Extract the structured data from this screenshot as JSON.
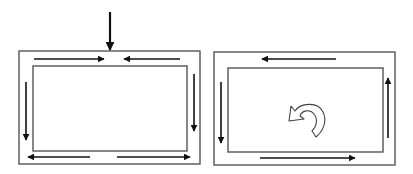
{
  "diagram": {
    "colors": {
      "background": "#ffffff",
      "frame_stroke": "#555555",
      "arrow": "#111111",
      "curved_arrow_fill": "#ffffff",
      "curved_arrow_stroke": "#444444"
    },
    "panels": [
      {
        "id": "left",
        "label": "",
        "outer_rect": {
          "x": 19,
          "y": 51,
          "w": 181,
          "h": 113
        },
        "inner_rect": {
          "x": 33,
          "y": 66,
          "w": 154,
          "h": 85
        },
        "inflow_arrow": {
          "direction": "down",
          "x": 110,
          "y1": 12,
          "y2": 50
        },
        "arrows": [
          {
            "position": "top-left",
            "direction": "right",
            "x1": 34,
            "y1": 59,
            "x2": 104,
            "y2": 59
          },
          {
            "position": "top-right",
            "direction": "left",
            "x1": 180,
            "y1": 59,
            "x2": 124,
            "y2": 59
          },
          {
            "position": "left",
            "direction": "down",
            "x1": 26,
            "y1": 82,
            "x2": 26,
            "y2": 140
          },
          {
            "position": "right",
            "direction": "down",
            "x1": 194,
            "y1": 74,
            "x2": 194,
            "y2": 131
          },
          {
            "position": "bottom-left",
            "direction": "left",
            "x1": 90,
            "y1": 157,
            "x2": 28,
            "y2": 157
          },
          {
            "position": "bottom-right",
            "direction": "right",
            "x1": 117,
            "y1": 157,
            "x2": 190,
            "y2": 157
          }
        ]
      },
      {
        "id": "right",
        "label": "",
        "outer_rect": {
          "x": 214,
          "y": 52,
          "w": 181,
          "h": 113
        },
        "inner_rect": {
          "x": 228,
          "y": 68,
          "w": 155,
          "h": 84
        },
        "arrows": [
          {
            "position": "top",
            "direction": "left",
            "x1": 336,
            "y1": 59,
            "x2": 262,
            "y2": 59
          },
          {
            "position": "left",
            "direction": "down",
            "x1": 221,
            "y1": 82,
            "x2": 221,
            "y2": 143
          },
          {
            "position": "right",
            "direction": "up",
            "x1": 388,
            "y1": 138,
            "x2": 388,
            "y2": 78
          },
          {
            "position": "bottom",
            "direction": "right",
            "x1": 260,
            "y1": 158,
            "x2": 355,
            "y2": 158
          }
        ],
        "rotation_indicator": {
          "direction": "counterclockwise",
          "cx": 306,
          "cy": 118
        }
      }
    ]
  }
}
